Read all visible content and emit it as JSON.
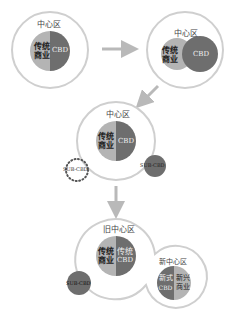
{
  "colors": {
    "outline": "#c8c8c8",
    "light_segment": "#b4b4b4",
    "dark_segment": "#6e6e6e",
    "arrow": "#b9b9b9",
    "text_dark": "#333333",
    "text_light": "#f0f0f0"
  },
  "stage1": {
    "zone_label": "中心区",
    "traditional_line1": "传统",
    "traditional_line2": "商业",
    "cbd_label": "CBD"
  },
  "stage2": {
    "zone_label": "中心区",
    "traditional_line1": "传统",
    "traditional_line2": "商业",
    "cbd_label": "CBD"
  },
  "stage3": {
    "zone_label": "中心区",
    "traditional_line1": "传统",
    "traditional_line2": "商业",
    "cbd_label": "CBD",
    "sub_cbd_planned": "SUB-CBD",
    "sub_cbd_existing": "SUB-CBD"
  },
  "stage4": {
    "old_zone_label": "旧中心区",
    "traditional_line1": "传统",
    "traditional_line2": "商业",
    "traditional_cbd_line1": "传统",
    "traditional_cbd_line2": "CBD",
    "sub_cbd": "SUB-CBD",
    "new_zone_label": "新中心区",
    "new_cbd_line1": "新式",
    "new_cbd_line2": "CBD",
    "new_commerce_line1": "新兴",
    "new_commerce_line2": "商业"
  }
}
